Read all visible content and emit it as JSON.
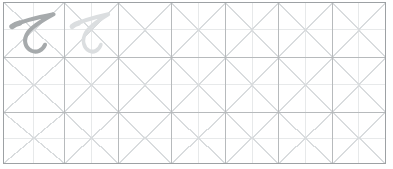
{
  "worksheet": {
    "type": "handwriting-practice-grid",
    "rows": 3,
    "columns": 7,
    "colors": {
      "outer_border": "#9da1a4",
      "cell_border": "#b7babc",
      "diagonal_guide": "#d9dcde",
      "midline_guide": "#e7e9ea",
      "center_dot": "#c9ccce",
      "example_character": "#a6aaac",
      "trace_character": "#dbdee0",
      "background": "#ffffff"
    },
    "example_cell": {
      "row": 1,
      "column": 1,
      "char": "て",
      "style": "example",
      "label": "te hiragana example"
    },
    "trace_cell": {
      "row": 1,
      "column": 2,
      "char": "て",
      "style": "trace",
      "label": "te hiragana trace guide"
    }
  }
}
